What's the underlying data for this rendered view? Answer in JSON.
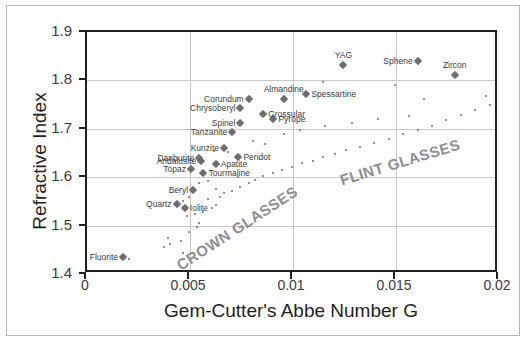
{
  "chart_data": {
    "type": "scatter",
    "title": "",
    "xlabel": "Gem-Cutter's Abbe Number G",
    "ylabel": "Refractive Index",
    "xlim": [
      0,
      0.02
    ],
    "ylim": [
      1.4,
      1.9
    ],
    "xticks": [
      "0",
      "0.005",
      "0.01",
      "0.015",
      "0.02"
    ],
    "xtick_values": [
      0,
      0.005,
      0.01,
      0.015,
      0.02
    ],
    "yticks": [
      "1.4",
      "1.5",
      "1.6",
      "1.7",
      "1.8",
      "1.9"
    ],
    "ytick_values": [
      1.4,
      1.5,
      1.6,
      1.7,
      1.8,
      1.9
    ],
    "grid": true,
    "legend": "none",
    "marker_color": "#6e6e72",
    "axis_color": "#231f20",
    "grid_color": "#c8c8c8",
    "annotations": [
      {
        "text": "CROWN GLASSES",
        "x": 0.0073,
        "y": 1.495,
        "rotation": -33
      },
      {
        "text": "FLINT GLASSES",
        "x": 0.0152,
        "y": 1.632,
        "rotation": -17
      }
    ],
    "series": [
      {
        "name": "Named gemstones",
        "marker": "diamond",
        "points": [
          {
            "label": "Fluorite",
            "x": 0.00175,
            "y": 1.4345,
            "label_pos": "left"
          },
          {
            "label": "Quartz",
            "x": 0.00435,
            "y": 1.5455,
            "label_pos": "left"
          },
          {
            "label": "Iolite",
            "x": 0.00475,
            "y": 1.5355,
            "label_pos": "right"
          },
          {
            "label": "Beryl",
            "x": 0.00515,
            "y": 1.5745,
            "label_pos": "left"
          },
          {
            "label": "Topaz",
            "x": 0.00505,
            "y": 1.6175,
            "label_pos": "left"
          },
          {
            "label": "Andalusite",
            "x": 0.00555,
            "y": 1.6335,
            "label_pos": "left"
          },
          {
            "label": "Danburite",
            "x": 0.00545,
            "y": 1.6405,
            "label_pos": "left"
          },
          {
            "label": "Tourmaline",
            "x": 0.00565,
            "y": 1.6085,
            "label_pos": "right"
          },
          {
            "label": "Apatite",
            "x": 0.00625,
            "y": 1.6265,
            "label_pos": "right"
          },
          {
            "label": "Kunzite",
            "x": 0.00665,
            "y": 1.6605,
            "label_pos": "left"
          },
          {
            "label": "Peridot",
            "x": 0.00735,
            "y": 1.6425,
            "label_pos": "right"
          },
          {
            "label": "Tanzanite",
            "x": 0.00705,
            "y": 1.6925,
            "label_pos": "left"
          },
          {
            "label": "Spinel",
            "x": 0.00745,
            "y": 1.7125,
            "label_pos": "left"
          },
          {
            "label": "Chrysoberyl",
            "x": 0.00745,
            "y": 1.7435,
            "label_pos": "left"
          },
          {
            "label": "Corundum",
            "x": 0.00785,
            "y": 1.7625,
            "label_pos": "left"
          },
          {
            "label": "Grossular",
            "x": 0.00855,
            "y": 1.7305,
            "label_pos": "right"
          },
          {
            "label": "Pyrope",
            "x": 0.00905,
            "y": 1.7195,
            "label_pos": "right"
          },
          {
            "label": "Almandine",
            "x": 0.00955,
            "y": 1.7615,
            "label_pos": "above"
          },
          {
            "label": "Spessartine",
            "x": 0.01065,
            "y": 1.7725,
            "label_pos": "right"
          },
          {
            "label": "YAG",
            "x": 0.01245,
            "y": 1.8325,
            "label_pos": "above"
          },
          {
            "label": "Sphene",
            "x": 0.01605,
            "y": 1.8405,
            "label_pos": "left"
          },
          {
            "label": "Zircon",
            "x": 0.01785,
            "y": 1.8105,
            "label_pos": "above"
          }
        ]
      },
      {
        "name": "Unlabeled glasses",
        "marker": "dot",
        "points": [
          {
            "x": 0.00375,
            "y": 1.4565
          },
          {
            "x": 0.00405,
            "y": 1.4625
          },
          {
            "x": 0.00395,
            "y": 1.4745
          },
          {
            "x": 0.00455,
            "y": 1.4685
          },
          {
            "x": 0.00495,
            "y": 1.4865
          },
          {
            "x": 0.00535,
            "y": 1.4975
          },
          {
            "x": 0.00545,
            "y": 1.5055
          },
          {
            "x": 0.00485,
            "y": 1.5195
          },
          {
            "x": 0.00525,
            "y": 1.5235
          },
          {
            "x": 0.00565,
            "y": 1.5285
          },
          {
            "x": 0.00605,
            "y": 1.5355
          },
          {
            "x": 0.00625,
            "y": 1.5425
          },
          {
            "x": 0.00585,
            "y": 1.5555
          },
          {
            "x": 0.00645,
            "y": 1.5595
          },
          {
            "x": 0.00665,
            "y": 1.5665
          },
          {
            "x": 0.00705,
            "y": 1.5725
          },
          {
            "x": 0.00745,
            "y": 1.5805
          },
          {
            "x": 0.00785,
            "y": 1.5885
          },
          {
            "x": 0.00815,
            "y": 1.5945
          },
          {
            "x": 0.00855,
            "y": 1.6025
          },
          {
            "x": 0.00905,
            "y": 1.6085
          },
          {
            "x": 0.00945,
            "y": 1.6155
          },
          {
            "x": 0.00995,
            "y": 1.6215
          },
          {
            "x": 0.01045,
            "y": 1.6285
          },
          {
            "x": 0.01095,
            "y": 1.6345
          },
          {
            "x": 0.01145,
            "y": 1.6425
          },
          {
            "x": 0.01205,
            "y": 1.6485
          },
          {
            "x": 0.01255,
            "y": 1.6555
          },
          {
            "x": 0.01325,
            "y": 1.6625
          },
          {
            "x": 0.01395,
            "y": 1.6705
          },
          {
            "x": 0.01465,
            "y": 1.6785
          },
          {
            "x": 0.01535,
            "y": 1.6885
          },
          {
            "x": 0.01605,
            "y": 1.6965
          },
          {
            "x": 0.01675,
            "y": 1.7055
          },
          {
            "x": 0.01745,
            "y": 1.7175
          },
          {
            "x": 0.01815,
            "y": 1.7275
          },
          {
            "x": 0.01885,
            "y": 1.7385
          },
          {
            "x": 0.01955,
            "y": 1.7485
          },
          {
            "x": 0.00955,
            "y": 1.6885
          },
          {
            "x": 0.01035,
            "y": 1.6965
          },
          {
            "x": 0.01155,
            "y": 1.7055
          },
          {
            "x": 0.01285,
            "y": 1.7125
          },
          {
            "x": 0.01415,
            "y": 1.7205
          },
          {
            "x": 0.01565,
            "y": 1.7265
          },
          {
            "x": 0.00805,
            "y": 1.6755
          },
          {
            "x": 0.00685,
            "y": 1.6525
          },
          {
            "x": 0.00615,
            "y": 1.6545
          },
          {
            "x": 0.00585,
            "y": 1.5915
          },
          {
            "x": 0.00545,
            "y": 1.5875
          },
          {
            "x": 0.00495,
            "y": 1.5585
          },
          {
            "x": 0.00465,
            "y": 1.5505
          },
          {
            "x": 0.00625,
            "y": 1.5755
          },
          {
            "x": 0.01145,
            "y": 1.7975
          },
          {
            "x": 0.01495,
            "y": 1.7905
          },
          {
            "x": 0.00465,
            "y": 1.4425
          },
          {
            "x": 0.00205,
            "y": 1.4315
          },
          {
            "x": 0.01635,
            "y": 1.7625
          },
          {
            "x": 0.01935,
            "y": 1.7685
          },
          {
            "x": 0.00865,
            "y": 1.6695
          },
          {
            "x": 0.00735,
            "y": 1.5995
          }
        ]
      }
    ]
  }
}
